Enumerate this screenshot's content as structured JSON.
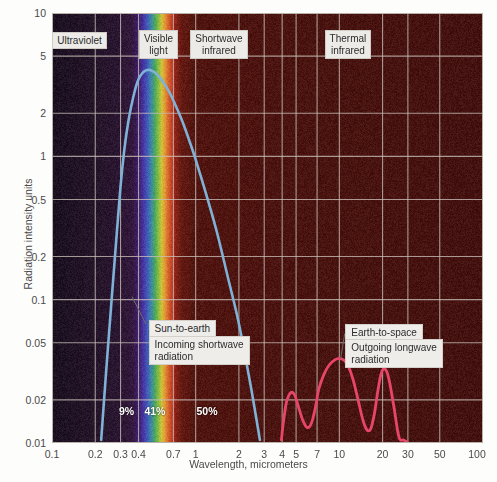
{
  "chart_data": {
    "type": "line",
    "title": "",
    "xlabel": "Wavelength, micrometers",
    "ylabel": "Radiation intensity units",
    "xscale": "log",
    "yscale": "log",
    "xlim": [
      0.1,
      100
    ],
    "ylim": [
      0.01,
      10
    ],
    "grid": true,
    "legend": "none",
    "xticks": [
      "0.1",
      "0.2",
      "0.3",
      "0.4",
      "0.7",
      "1",
      "2",
      "3",
      "4",
      "5",
      "7",
      "10",
      "20",
      "30",
      "50",
      "100"
    ],
    "xtick_values": [
      0.1,
      0.2,
      0.3,
      0.4,
      0.7,
      1,
      2,
      3,
      4,
      5,
      7,
      10,
      20,
      30,
      50,
      100
    ],
    "yticks": [
      "10",
      "5",
      "2",
      "1",
      "0.5",
      "0.2",
      "0.1",
      "0.05",
      "0.02",
      "0.01"
    ],
    "ytick_values": [
      10,
      5,
      2,
      1,
      0.5,
      0.2,
      0.1,
      0.05,
      0.02,
      0.01
    ],
    "series": [
      {
        "name": "Sun-to-earth incoming shortwave radiation",
        "color": "#7fb2d6",
        "x": [
          0.22,
          0.24,
          0.26,
          0.28,
          0.3,
          0.32,
          0.34,
          0.36,
          0.38,
          0.4,
          0.43,
          0.46,
          0.5,
          0.55,
          0.6,
          0.65,
          0.7,
          0.8,
          0.9,
          1.0,
          1.2,
          1.4,
          1.7,
          2.0,
          2.4,
          2.8
        ],
        "y": [
          0.0105,
          0.035,
          0.1,
          0.26,
          0.62,
          1.15,
          1.75,
          2.35,
          2.95,
          3.45,
          3.85,
          4.0,
          3.95,
          3.65,
          3.25,
          2.85,
          2.45,
          1.8,
          1.3,
          0.95,
          0.52,
          0.3,
          0.135,
          0.068,
          0.026,
          0.0105
        ]
      },
      {
        "name": "Earth-to-space outgoing longwave radiation",
        "color": "#e8456a",
        "x": [
          3.95,
          4.1,
          4.3,
          4.6,
          4.9,
          5.2,
          5.6,
          6.0,
          6.4,
          6.8,
          7.2,
          7.8,
          8.5,
          9.3,
          10.0,
          10.8,
          11.6,
          12.5,
          13.5,
          14.5,
          15.5,
          16.5,
          17.5,
          18.5,
          19.5,
          20.5,
          21.5,
          22.5,
          24.0,
          26.0,
          28.0,
          29.5
        ],
        "y": [
          0.0105,
          0.0145,
          0.0195,
          0.0225,
          0.0215,
          0.0178,
          0.0142,
          0.0128,
          0.0138,
          0.0175,
          0.0238,
          0.03,
          0.035,
          0.038,
          0.039,
          0.0378,
          0.034,
          0.0275,
          0.02,
          0.0148,
          0.0124,
          0.0125,
          0.0158,
          0.0228,
          0.0302,
          0.033,
          0.031,
          0.0258,
          0.0178,
          0.011,
          0.0105,
          0.0102
        ]
      }
    ],
    "band_labels": [
      {
        "name": "ultraviolet",
        "text": "Ultraviolet",
        "x_center": 0.155,
        "y_center": 6.4
      },
      {
        "name": "visible-light",
        "text": "Visible\nlight",
        "x_center": 0.55,
        "y_center": 6.0
      },
      {
        "name": "shortwave-infrared",
        "text": "Shortwave\ninfrared",
        "x_center": 1.45,
        "y_center": 6.0
      },
      {
        "name": "thermal-infrared",
        "text": "Thermal\ninfrared",
        "x_center": 11.5,
        "y_center": 6.0
      }
    ],
    "annotations": [
      {
        "name": "sun-to-earth",
        "text": "Sun-to-earth",
        "x": 0.47,
        "y": 0.062
      },
      {
        "name": "incoming-shortwave-radiation",
        "text": "Incoming shortwave\nradiation",
        "x": 0.47,
        "y": 0.044
      },
      {
        "name": "earth-to-space",
        "text": "Earth-to-space",
        "x": 11.0,
        "y": 0.059
      },
      {
        "name": "outgoing-longwave-radiation",
        "text": "Outgoing longwave\nradiation",
        "x": 11.0,
        "y": 0.042
      }
    ],
    "percent_labels": [
      {
        "name": "pct-ultraviolet",
        "text": "9%",
        "x": 0.33,
        "y": 0.0165
      },
      {
        "name": "pct-visible",
        "text": "41%",
        "x": 0.52,
        "y": 0.0165
      },
      {
        "name": "pct-infrared",
        "text": "50%",
        "x": 1.2,
        "y": 0.0165
      }
    ],
    "colors": {
      "shortwave_curve": "#7fb2d6",
      "longwave_curve": "#e8456a",
      "ultraviolet_bg": "#241528",
      "infrared_bg": "#4a1410",
      "grid": "#c9bfb8",
      "label_box": "#ecebe8"
    }
  }
}
